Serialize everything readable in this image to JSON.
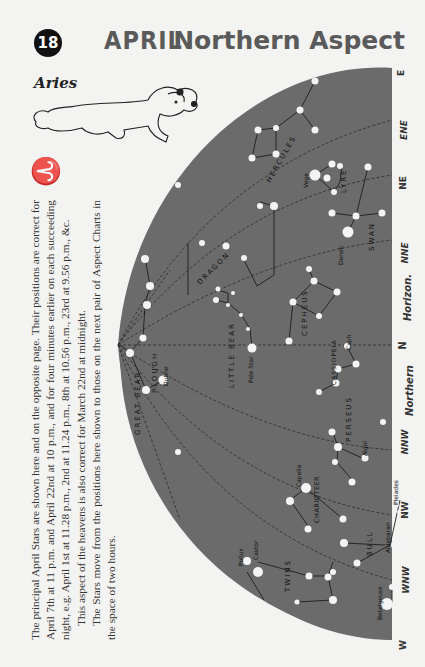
{
  "header": {
    "page_number": "18",
    "month": "APRIL",
    "title": "Northern Aspect"
  },
  "zodiac": {
    "name": "Aries",
    "symbol": "♈"
  },
  "description": {
    "paragraph1": "The principal April Stars are shown here and on the opposite page. Their positions are correct for April 7th at 11 p.m. and April 22nd at 10 p.m., and for four minutes earlier on each succeeding night, e.g. April 1st at 11.28 p.m., 2nd at 11.24 p.m., 8th at 10.56 p.m., 23rd at 9.56 p.m., &c.",
    "paragraph2": "This aspect of the heavens is also correct for March 22nd at midnight.",
    "paragraph3": "The Stars move from the positions here shown to those on the next pair of Aspect Charts in the space of two hours."
  },
  "compass": {
    "E": "E",
    "ENE": "ENE",
    "NE": "NE",
    "NNE": "NNE",
    "horizon": "Horizon.",
    "N": "N",
    "northern": "Northern",
    "NNW": "NNW",
    "NW": "NW",
    "WNW": "WNW",
    "W": "W"
  },
  "constellations": {
    "hercules": "HERCULES",
    "lyre": "LYRE",
    "swan": "SWAN",
    "dragon": "DRAGON",
    "great_bear": "GREAT BEAR",
    "plough": "PLOUGH",
    "little_bear": "LITTLE BEAR",
    "cepheus": "CEPHEUS",
    "cassiopeia": "CASSIOPEIA",
    "perseus": "PERSEUS",
    "charioteer": "CHARIOTEER",
    "bull": "BULL",
    "twins": "TWINS"
  },
  "stars": {
    "vega": "Vega",
    "deneb": "Deneb",
    "dubhe": "Dubhe",
    "pole_star": "Pole Star",
    "caph": "Caph",
    "algol": "Algol",
    "capella": "Capella",
    "aldebaran": "Aldebaran",
    "pleiades": "Pleiades",
    "pollux": "Pollux",
    "castor": "Castor",
    "betelgeuse": "Betelgeuse"
  },
  "colors": {
    "sky": "#6b6b6b",
    "page": "#f3f3f1",
    "heading": "#5a5a5a",
    "star": "#f4f4f4"
  }
}
